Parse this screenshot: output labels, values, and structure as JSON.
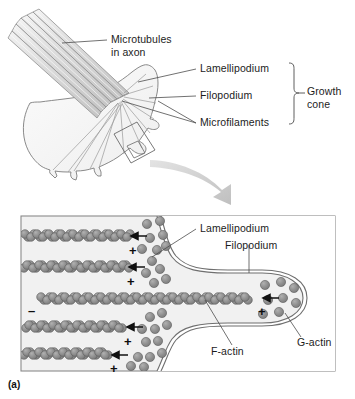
{
  "figure": {
    "caption": "(a)",
    "top_panel": {
      "name": "growth-cone-overview",
      "labels": {
        "microtubules": "Microtubules",
        "microtubules_line2": "in axon",
        "lamellipodium": "Lamellipodium",
        "filopodium": "Filopodium",
        "microfilaments": "Microfilaments",
        "growth_cone": "Growth",
        "growth_cone_line2": "cone"
      }
    },
    "bottom_panel": {
      "name": "actin-dynamics-detail",
      "labels": {
        "lamellipodium": "Lamellipodium",
        "filopodium": "Filopodium",
        "f_actin": "F-actin",
        "g_actin": "G-actin"
      },
      "polarity_signs": {
        "minus": "–",
        "plus": "+"
      },
      "filament_plus_ends": [
        "+",
        "+",
        "+",
        "+",
        "+"
      ],
      "filament_minus_ends": [
        "–"
      ]
    },
    "colors": {
      "actin_subunit_fill": "#8e8e8e",
      "actin_subunit_stroke": "#5c5c5c",
      "membrane_stroke": "#6f6f6f",
      "cytoplasm_fill": "#f2f2f2",
      "microtubule_fill": "#d9d9d9",
      "microtubule_stroke": "#8c8c8c",
      "growth_cone_fill": "#f7f7f7",
      "arrow_fill": "#c9c9c9",
      "panel_border": "#8a8a8a",
      "text": "#1c1c1c",
      "leader_line": "#4d4d4d"
    }
  }
}
